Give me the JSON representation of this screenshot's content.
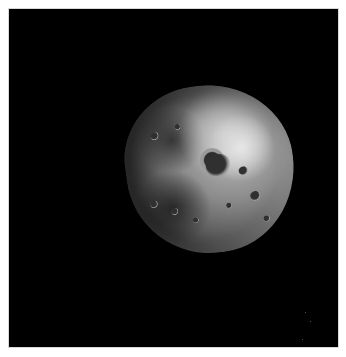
{
  "image": {
    "subject": "cratered asteroid / small moon",
    "background_color": "#000000",
    "frame_color": "#ffffff"
  }
}
